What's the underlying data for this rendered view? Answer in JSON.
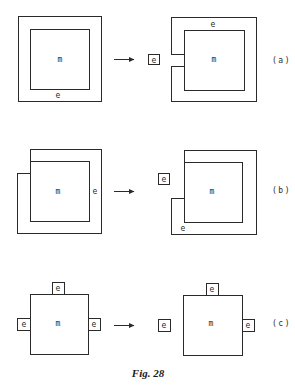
{
  "figure": {
    "caption": "Fig. 28",
    "rows": [
      {
        "id": "a",
        "tag": "(a)",
        "before": {
          "inner_label": "m",
          "shell_label": "e"
        },
        "after": {
          "inner_label": "m",
          "shell_label": "e",
          "detached_label": "e"
        }
      },
      {
        "id": "b",
        "tag": "(b)",
        "before": {
          "inner_label": "m",
          "shell_label": "e"
        },
        "after": {
          "inner_label": "m",
          "shell_label": "e",
          "detached_label": "e"
        }
      },
      {
        "id": "c",
        "tag": "(c)",
        "before": {
          "inner_label": "m",
          "top_label": "e",
          "left_label": "e",
          "right_label": "e"
        },
        "after": {
          "inner_label": "m",
          "top_label": "e",
          "detached_label": "e",
          "right_label": "e"
        }
      }
    ]
  }
}
